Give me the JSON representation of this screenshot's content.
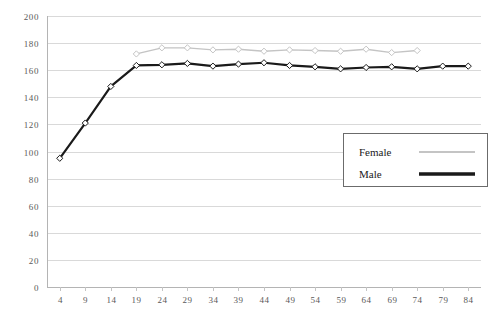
{
  "chart_data": {
    "type": "line",
    "title": "",
    "subtitle": "",
    "xlabel": "",
    "ylabel": "",
    "grid": true,
    "xlim": [
      4,
      84
    ],
    "ylim": [
      0,
      200
    ],
    "ytick_step": 20,
    "yticks": [
      "0",
      "20",
      "40",
      "60",
      "80",
      "100",
      "120",
      "140",
      "160",
      "180",
      "200"
    ],
    "categories": [
      "4",
      "9",
      "14",
      "19",
      "24",
      "29",
      "34",
      "39",
      "44",
      "49",
      "54",
      "59",
      "64",
      "69",
      "74",
      "79",
      "84"
    ],
    "legend_position": "inside-right-middle",
    "series": [
      {
        "name": "Female",
        "color": "#c4c4c4",
        "line_width": 1.4,
        "marker": "open-diamond",
        "values": [
          null,
          null,
          null,
          172.0,
          176.5,
          176.5,
          175.0,
          175.5,
          174.0,
          175.0,
          174.5,
          174.0,
          175.5,
          173.0,
          174.5,
          null,
          null
        ]
      },
      {
        "name": "Male",
        "color": "#1a1a1a",
        "line_width": 2.2,
        "marker": "open-diamond",
        "values": [
          95.0,
          121.0,
          148.0,
          163.5,
          164.0,
          165.0,
          163.0,
          164.5,
          165.5,
          163.5,
          162.5,
          161.0,
          162.0,
          162.5,
          161.0,
          163.0,
          163.0
        ]
      }
    ]
  },
  "legend": {
    "items": [
      {
        "label": "Female",
        "color": "#c4c4c4",
        "line_width": 2
      },
      {
        "label": "Male",
        "color": "#1a1a1a",
        "line_width": 3.6
      }
    ]
  },
  "colors": {
    "female": "#c4c4c4",
    "male": "#1a1a1a",
    "gridline": "#d9d9d9",
    "axis": "#b4b4b4",
    "tick_text": "#5a5a5a",
    "legend_border": "#6b6b6b",
    "background": "#ffffff"
  }
}
